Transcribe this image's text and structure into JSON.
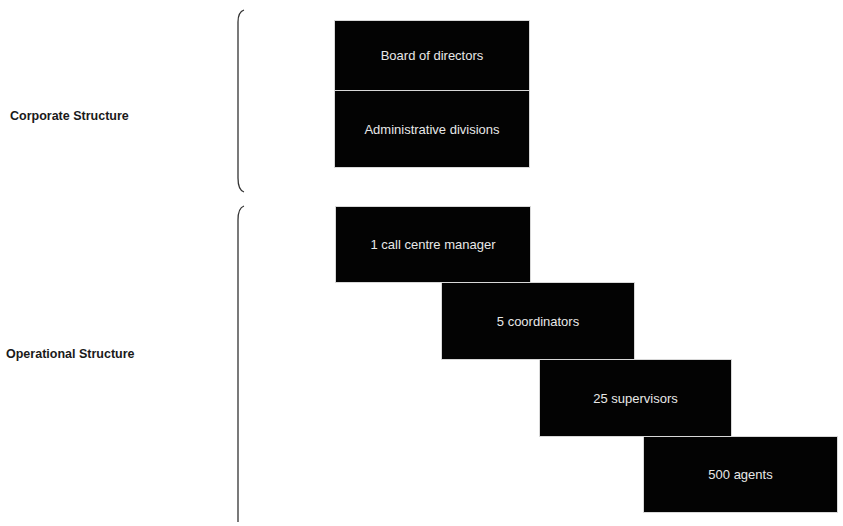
{
  "groups": [
    {
      "label": "Corporate Structure",
      "boxes": [
        "Board of directors",
        "Administrative divisions"
      ]
    },
    {
      "label": "Operational Structure",
      "boxes": [
        "1 call centre manager",
        "5 coordinators",
        "25 supervisors",
        "500 agents"
      ]
    }
  ],
  "colors": {
    "box_fill": "#030303",
    "box_text": "#e8e8e8",
    "label_text": "#1a1a1a",
    "background": "#ffffff"
  }
}
